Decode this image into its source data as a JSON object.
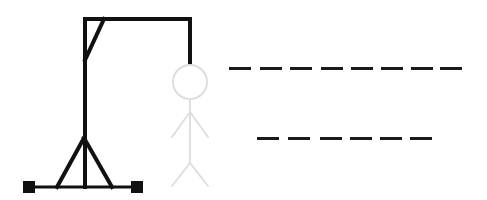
{
  "game": {
    "name": "Hangman",
    "colors": {
      "gallows": "#111111",
      "figure": "#dedede",
      "slot": "#1a1a1a",
      "background": "#ffffff"
    },
    "figure_parts_visible": [
      "head",
      "body",
      "left-arm",
      "right-arm",
      "left-leg",
      "right-leg"
    ],
    "words": [
      {
        "row": 1,
        "letters": [
          "",
          "",
          "",
          "",
          "",
          "",
          "",
          ""
        ],
        "slot_x": [
          229,
          260,
          290,
          321,
          351,
          381,
          411,
          440
        ],
        "y": 67
      },
      {
        "row": 2,
        "letters": [
          "",
          "",
          "",
          "",
          "",
          ""
        ],
        "slot_x": [
          257,
          288,
          320,
          350,
          380,
          410
        ],
        "y": 137
      }
    ]
  }
}
